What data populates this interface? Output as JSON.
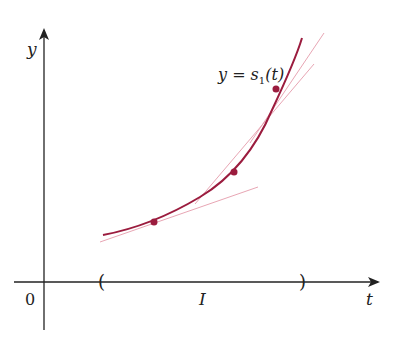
{
  "figure": {
    "axes": {
      "y_label": "y",
      "x_label": "t",
      "origin_label": "0"
    },
    "curve": {
      "label_lhs": "y = s",
      "label_subscript": "1",
      "label_rhs": "(t)",
      "color": "#9b1c3e"
    },
    "interval": {
      "label": "I",
      "left_bracket": "(",
      "right_bracket": ")"
    },
    "tangent_color": "#e8a6b4",
    "axis_color": "#222222",
    "points": [
      {
        "x": 154,
        "y": 222
      },
      {
        "x": 234,
        "y": 172
      },
      {
        "x": 276,
        "y": 89
      }
    ]
  }
}
